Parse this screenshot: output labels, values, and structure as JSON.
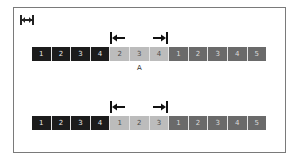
{
  "diagram": {
    "icon": "span-width-icon",
    "colors": {
      "dark": "#1c1c1c",
      "light": "#bcbcbc",
      "mid": "#6a6a6a",
      "frame": "#7a7a7a"
    },
    "rows": [
      {
        "cells": [
          {
            "label": "1",
            "tone": "dark"
          },
          {
            "label": "2",
            "tone": "dark"
          },
          {
            "label": "3",
            "tone": "dark"
          },
          {
            "label": "4",
            "tone": "dark"
          },
          {
            "label": "2",
            "tone": "light"
          },
          {
            "label": "3",
            "tone": "light"
          },
          {
            "label": "4",
            "tone": "light"
          },
          {
            "label": "1",
            "tone": "mid"
          },
          {
            "label": "2",
            "tone": "mid"
          },
          {
            "label": "3",
            "tone": "mid"
          },
          {
            "label": "4",
            "tone": "mid"
          },
          {
            "label": "5",
            "tone": "mid"
          }
        ],
        "start_marker": "left-bracket-arrow-icon",
        "end_marker": "right-bracket-arrow-icon",
        "caption": "A"
      },
      {
        "cells": [
          {
            "label": "1",
            "tone": "dark"
          },
          {
            "label": "2",
            "tone": "dark"
          },
          {
            "label": "3",
            "tone": "dark"
          },
          {
            "label": "4",
            "tone": "dark"
          },
          {
            "label": "1",
            "tone": "light"
          },
          {
            "label": "2",
            "tone": "light"
          },
          {
            "label": "3",
            "tone": "light"
          },
          {
            "label": "1",
            "tone": "mid"
          },
          {
            "label": "2",
            "tone": "mid"
          },
          {
            "label": "3",
            "tone": "mid"
          },
          {
            "label": "4",
            "tone": "mid"
          },
          {
            "label": "5",
            "tone": "mid"
          }
        ],
        "start_marker": "left-bracket-arrow-icon",
        "end_marker": "right-bracket-arrow-icon",
        "caption": ""
      }
    ]
  }
}
